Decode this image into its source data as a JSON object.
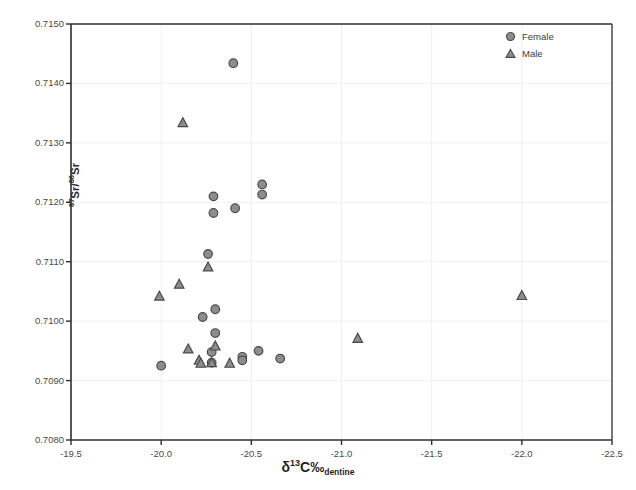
{
  "chart_data": {
    "type": "scatter",
    "title": "",
    "xlabel": "δ¹³C‰ dentine",
    "ylabel": "⁸⁷Sr/⁸⁶Sr",
    "xlim": [
      -19.5,
      -22.5
    ],
    "ylim": [
      0.708,
      0.715
    ],
    "x_ticks": [
      -19.5,
      -20.0,
      -20.5,
      -21.0,
      -21.5,
      -22.0,
      -22.5
    ],
    "x_tick_labels": [
      "-19.5",
      "-20.0",
      "-20.5",
      "-21.0",
      "-21.5",
      "-22.0",
      "-22.5"
    ],
    "y_ticks": [
      0.708,
      0.709,
      0.71,
      0.711,
      0.712,
      0.713,
      0.714,
      0.715
    ],
    "y_tick_labels": [
      "0.7080",
      "0.7090",
      "0.7100",
      "0.7110",
      "0.7120",
      "0.7130",
      "0.7140",
      "0.7150"
    ],
    "x_axis_reversed": true,
    "grid": true,
    "grid_color": "#f0f0f0",
    "legend_position": "top-right",
    "marker_fill": "#8d8d8d",
    "marker_edge": "#4a4a4a",
    "series": [
      {
        "name": "Female",
        "marker": "circle",
        "points": [
          {
            "x": -20.4,
            "y": 0.71434
          },
          {
            "x": -20.29,
            "y": 0.7121
          },
          {
            "x": -20.29,
            "y": 0.71182
          },
          {
            "x": -20.41,
            "y": 0.7119
          },
          {
            "x": -20.56,
            "y": 0.7123
          },
          {
            "x": -20.56,
            "y": 0.71213
          },
          {
            "x": -20.26,
            "y": 0.71113
          },
          {
            "x": -20.3,
            "y": 0.7102
          },
          {
            "x": -20.23,
            "y": 0.71007
          },
          {
            "x": -20.3,
            "y": 0.7098
          },
          {
            "x": -20.28,
            "y": 0.70948
          },
          {
            "x": -20.0,
            "y": 0.70925
          },
          {
            "x": -20.28,
            "y": 0.7093
          },
          {
            "x": -20.45,
            "y": 0.7094
          },
          {
            "x": -20.45,
            "y": 0.70934
          },
          {
            "x": -20.54,
            "y": 0.7095
          },
          {
            "x": -20.66,
            "y": 0.70937
          }
        ]
      },
      {
        "name": "Male",
        "marker": "triangle",
        "points": [
          {
            "x": -20.12,
            "y": 0.71334
          },
          {
            "x": -20.26,
            "y": 0.71091
          },
          {
            "x": -20.1,
            "y": 0.71062
          },
          {
            "x": -19.99,
            "y": 0.71042
          },
          {
            "x": -20.3,
            "y": 0.70958
          },
          {
            "x": -20.15,
            "y": 0.70953
          },
          {
            "x": -20.21,
            "y": 0.70934
          },
          {
            "x": -20.22,
            "y": 0.70929
          },
          {
            "x": -20.28,
            "y": 0.7093
          },
          {
            "x": -20.38,
            "y": 0.70929
          },
          {
            "x": -21.09,
            "y": 0.70971
          },
          {
            "x": -22.0,
            "y": 0.71043
          }
        ]
      }
    ]
  },
  "legend": {
    "items": [
      {
        "label": "Female",
        "marker": "circle"
      },
      {
        "label": "Male",
        "marker": "triangle"
      }
    ]
  },
  "axes": {
    "y_title_main": "Sr/",
    "y_title_sup1": "87",
    "y_title_sup2": "86",
    "y_title_tail": "Sr",
    "x_title_delta": "δ",
    "x_title_sup": "13",
    "x_title_c": "C‰",
    "x_title_sub": "dentine"
  }
}
